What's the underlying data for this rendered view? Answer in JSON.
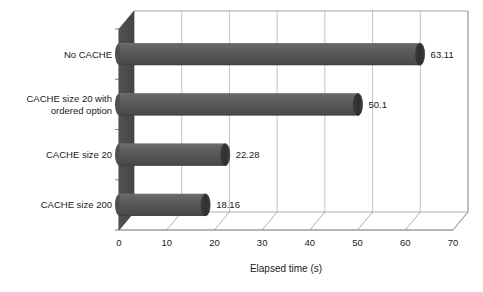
{
  "chart_data": {
    "type": "bar",
    "orientation": "horizontal",
    "style": "3d-cylinder",
    "title": "",
    "xlabel": "Elapsed time (s)",
    "ylabel": "",
    "categories": [
      "No CACHE",
      "CACHE size 20 with ordered option",
      "CACHE size 20",
      "CACHE size 200"
    ],
    "category_lines": [
      [
        "No CACHE"
      ],
      [
        "CACHE size 20 with",
        "ordered option"
      ],
      [
        "CACHE size 20"
      ],
      [
        "CACHE size 200"
      ]
    ],
    "values": [
      63.11,
      50.1,
      22.28,
      18.16
    ],
    "value_labels": [
      "63.11",
      "50.1",
      "22.28",
      "18.16"
    ],
    "xlim": [
      0,
      70
    ],
    "xticks": [
      0,
      10,
      20,
      30,
      40,
      50,
      60,
      70
    ],
    "xtick_labels": [
      "0",
      "10",
      "20",
      "30",
      "40",
      "50",
      "60",
      "70"
    ],
    "grid": true,
    "grid_axis": "x",
    "legend": false,
    "bar_color": "#565656",
    "bar_cap_color": "#3a3a3a",
    "wall_color": "#4a4a4a",
    "grid_color": "#b4b4b4",
    "axis_color": "#6e6e6e",
    "background": "#ffffff"
  }
}
